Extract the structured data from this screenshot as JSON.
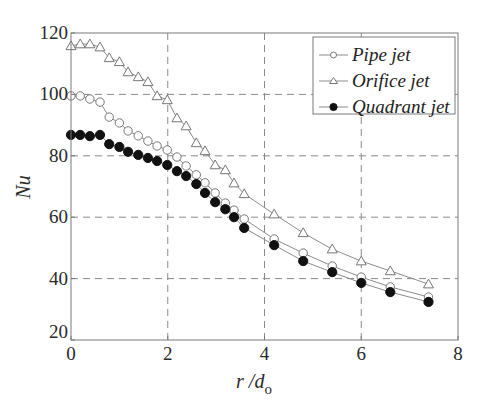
{
  "chart_data": {
    "type": "line",
    "title": "",
    "xlabel": "r /d",
    "xlabel_subscript": "o",
    "ylabel": "Nu",
    "xlim": [
      0,
      8
    ],
    "ylim": [
      20,
      120
    ],
    "xticks": [
      0,
      2,
      4,
      6,
      8
    ],
    "yticks": [
      20,
      40,
      60,
      80,
      100,
      120
    ],
    "xtick_labels": [
      "0",
      "2",
      "4",
      "6",
      "8"
    ],
    "ytick_labels": [
      "20",
      "40",
      "60",
      "80",
      "100",
      "120"
    ],
    "grid": true,
    "grid_style": "dashed",
    "legend_position": "upper right",
    "x": [
      0.0,
      0.19,
      0.39,
      0.6,
      0.79,
      1.0,
      1.18,
      1.39,
      1.59,
      1.78,
      1.99,
      2.19,
      2.38,
      2.59,
      2.77,
      2.98,
      3.19,
      3.37,
      3.58,
      4.2,
      4.8,
      5.4,
      6.0,
      6.6,
      7.39
    ],
    "series": [
      {
        "name": "Pipe jet",
        "marker": "circle-open",
        "values": [
          99.5,
          99.5,
          98.5,
          97.5,
          92.6,
          90.7,
          88.1,
          86.5,
          84.8,
          83.2,
          81.9,
          79.6,
          76.7,
          73.8,
          71.2,
          67.9,
          64.6,
          62.3,
          59.4,
          52.9,
          48.3,
          44.1,
          40.5,
          37.3,
          34.0
        ]
      },
      {
        "name": "Orifice jet",
        "marker": "triangle-open",
        "values": [
          115.8,
          116.4,
          116.4,
          115.4,
          111.9,
          110.6,
          107.3,
          105.7,
          104.1,
          99.5,
          98.2,
          92.3,
          89.7,
          84.2,
          81.6,
          77.0,
          75.4,
          71.1,
          67.6,
          61.0,
          54.9,
          49.6,
          45.7,
          42.5,
          38.2
        ]
      },
      {
        "name": "Quadrant jet",
        "marker": "circle-filled",
        "values": [
          86.8,
          86.8,
          86.4,
          86.8,
          83.8,
          82.9,
          81.3,
          80.3,
          79.3,
          78.3,
          77.0,
          75.0,
          73.4,
          70.8,
          67.9,
          64.9,
          62.6,
          60.0,
          56.5,
          50.9,
          45.7,
          42.1,
          38.6,
          35.6,
          32.4
        ]
      }
    ]
  },
  "colors": {
    "axis": "#7a7a7a",
    "grid": "#8a8a8a",
    "line": "#8c8c8c",
    "marker_open": "#777777",
    "marker_filled": "#111111",
    "text": "#2a2a2a"
  }
}
